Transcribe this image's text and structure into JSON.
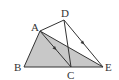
{
  "diagram": {
    "type": "geometry",
    "points": {
      "A": {
        "label": "A",
        "x": 40,
        "y": 31
      },
      "B": {
        "label": "B",
        "x": 24,
        "y": 67
      },
      "C": {
        "label": "C",
        "x": 71,
        "y": 67
      },
      "D": {
        "label": "D",
        "x": 64,
        "y": 20
      },
      "E": {
        "label": "E",
        "x": 103,
        "y": 67
      }
    },
    "shaded_region": [
      "A",
      "B",
      "E"
    ],
    "segments": [
      [
        "A",
        "B"
      ],
      [
        "B",
        "E"
      ],
      [
        "A",
        "E"
      ],
      [
        "A",
        "C"
      ],
      [
        "A",
        "D"
      ],
      [
        "D",
        "C"
      ],
      [
        "D",
        "E"
      ]
    ],
    "parallel_marks": [
      [
        "A",
        "C"
      ],
      [
        "D",
        "E"
      ]
    ],
    "colors": {
      "shade": "#c8c8c8",
      "line": "#333333"
    }
  }
}
